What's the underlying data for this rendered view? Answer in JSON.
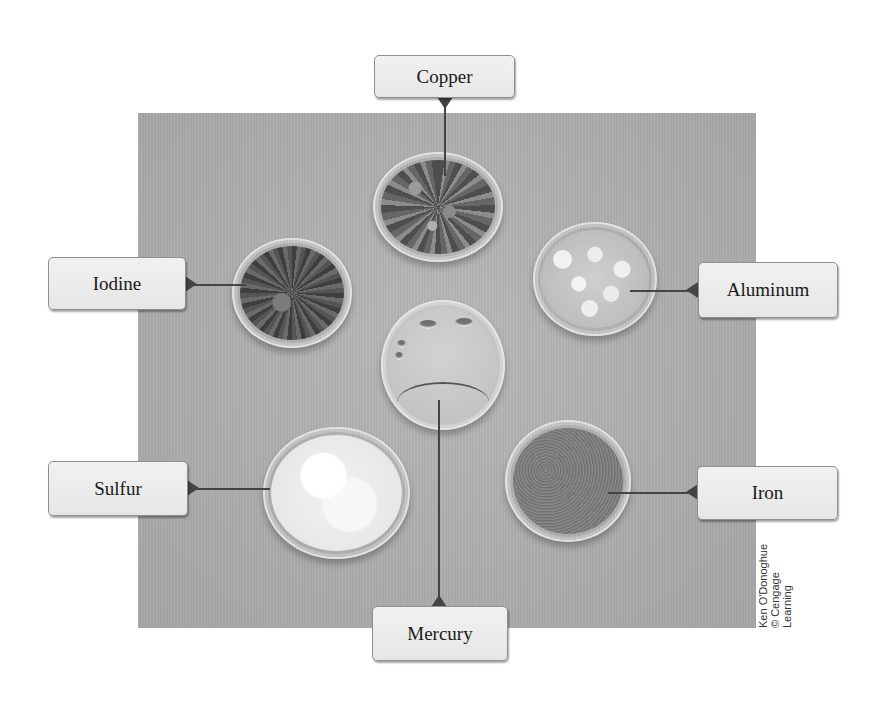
{
  "figure": {
    "labels": {
      "copper": "Copper",
      "iodine": "Iodine",
      "aluminum": "Aluminum",
      "mercury": "Mercury",
      "sulfur": "Sulfur",
      "iron": "Iron"
    },
    "credit": {
      "line1": "Ken O'Donoghue",
      "line2": "© Cengage",
      "line3": "Learning"
    },
    "colors": {
      "background": "#ffffff",
      "photo_backdrop": "#adadad",
      "label_fill": "#ececec",
      "label_border": "#8f8f8f",
      "leader_line": "#444444"
    }
  }
}
